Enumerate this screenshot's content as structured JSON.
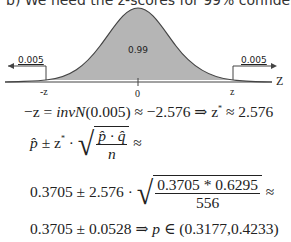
{
  "header": {
    "text": "b)   We need the z-scores for 99% confidence."
  },
  "figure": {
    "center_label": "0.99",
    "left_tail_label": "0.005",
    "right_tail_label": "0.005",
    "axis_label": "Z",
    "tick_left": "-z",
    "tick_center": "0",
    "tick_right": "z",
    "fill_color": "#b5b5b5",
    "line_color": "#444444"
  },
  "equations": {
    "line1": {
      "lhs": "−z = ",
      "fn": "invN",
      "arg": "(0.005)",
      "rest": " ≈ −2.576 ⇒ z",
      "star": "*",
      "tail": " ≈ 2.576"
    },
    "line2": {
      "p": "p̂",
      "pm": " ± z",
      "star": "*",
      "dot": " · ",
      "num": "p̂ · q̂",
      "den": "n",
      "approx": " ≈"
    },
    "line3": {
      "lead": "0.3705 ± 2.576 · ",
      "num": "0.3705 * 0.6295",
      "den": "556",
      "approx": " ≈"
    },
    "line4": {
      "lead": "0.3705 ± 0.0528 ⇒ ",
      "p": "p",
      "rest": " ∈ (0.3177,0.4233)"
    }
  }
}
